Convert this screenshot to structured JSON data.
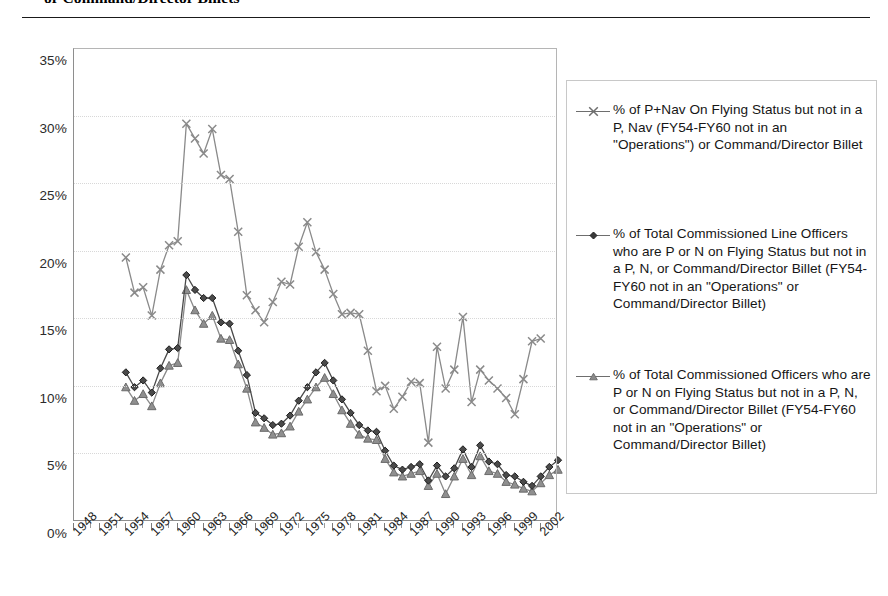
{
  "page": {
    "title_fragment": "or Command/Director Billets"
  },
  "legend": {
    "position": "right",
    "entries": [
      {
        "marker": "x-marker",
        "label": "% of P+Nav On Flying Status but not in a P, Nav (FY54-FY60 not in an \"Operations\") or Command/Director Billet",
        "color": "#808080"
      },
      {
        "marker": "diamond-marker",
        "label": "% of Total Commissioned Line Officers who are P or N on Flying Status but not in a P, N, or Command/Director Billet (FY54-FY60 not in an \"Operations\" or Command/Director Billet)",
        "color": "#3a3a3a"
      },
      {
        "marker": "triangle-marker",
        "label": "% of Total Commissioned Officers who are P or N on Flying Status but not in a P, N, or Command/Director Billet (FY54-FY60 not in an \"Operations\" or Command/Director Billet)",
        "color": "#808080"
      }
    ]
  },
  "chart_data": {
    "type": "line",
    "title": "or Command/Director Billets",
    "xlabel": "",
    "ylabel": "",
    "ylim": [
      0,
      35
    ],
    "ytick_labels": [
      "0%",
      "5%",
      "10%",
      "15%",
      "20%",
      "25%",
      "30%",
      "35%"
    ],
    "ytick_values": [
      0,
      5,
      10,
      15,
      20,
      25,
      30,
      35
    ],
    "grid": true,
    "xlim": [
      1948,
      2004
    ],
    "xtick_labels": [
      "1948",
      "1951",
      "1954",
      "1957",
      "1960",
      "1963",
      "1966",
      "1969",
      "1972",
      "1975",
      "1978",
      "1981",
      "1984",
      "1987",
      "1990",
      "1993",
      "1996",
      "1999",
      "2002"
    ],
    "xtick_values": [
      1948,
      1951,
      1954,
      1957,
      1960,
      1963,
      1966,
      1969,
      1972,
      1975,
      1978,
      1981,
      1984,
      1987,
      1990,
      1993,
      1996,
      1999,
      2002
    ],
    "x": [
      1954,
      1955,
      1956,
      1957,
      1958,
      1959,
      1960,
      1961,
      1962,
      1963,
      1964,
      1965,
      1966,
      1967,
      1968,
      1969,
      1970,
      1971,
      1972,
      1973,
      1974,
      1975,
      1976,
      1977,
      1978,
      1979,
      1980,
      1981,
      1982,
      1983,
      1984,
      1985,
      1986,
      1987,
      1988,
      1989,
      1990,
      1991,
      1992,
      1993,
      1994,
      1995,
      1996,
      1997,
      1998,
      1999,
      2000,
      2001,
      2002,
      2003,
      2004
    ],
    "series": [
      {
        "name": "% of P+Nav On Flying Status but not in a P, Nav (FY54-FY60 not in an \"Operations\") or Command/Director Billet",
        "marker": "x",
        "color": "#808080",
        "values": [
          19.5,
          16.9,
          17.3,
          15.2,
          18.6,
          20.4,
          20.7,
          29.4,
          28.3,
          27.2,
          29.0,
          25.6,
          25.3,
          21.4,
          16.7,
          15.6,
          14.7,
          16.2,
          17.7,
          17.5,
          20.3,
          22.1,
          19.9,
          18.6,
          16.8,
          15.3,
          15.4,
          15.3,
          12.6,
          9.6,
          10.0,
          8.3,
          9.2,
          10.3,
          10.2,
          5.8,
          12.9,
          9.8,
          11.2,
          15.1,
          8.8,
          11.2,
          10.4,
          9.8,
          9.1,
          7.9,
          10.5,
          13.3,
          13.5,
          null,
          null
        ]
      },
      {
        "name": "% of Total Commissioned Line Officers who are P or N on Flying Status but not in a P, N, or Command/Director Billet (FY54-FY60 not in an \"Operations\" or Command/Director Billet)",
        "marker": "diamond",
        "color": "#3a3a3a",
        "values": [
          11.0,
          9.9,
          10.4,
          9.5,
          11.3,
          12.7,
          12.8,
          18.2,
          17.1,
          16.5,
          16.5,
          14.7,
          14.6,
          12.6,
          10.8,
          8.0,
          7.6,
          7.1,
          7.2,
          7.8,
          8.9,
          9.9,
          11.0,
          11.7,
          10.4,
          9.0,
          8.0,
          7.1,
          6.7,
          6.6,
          5.2,
          4.1,
          3.8,
          4.0,
          4.2,
          3.0,
          4.1,
          3.3,
          3.9,
          5.3,
          4.0,
          5.6,
          4.4,
          4.2,
          3.4,
          3.3,
          2.9,
          2.6,
          3.3,
          4.0,
          4.5
        ]
      },
      {
        "name": "% of Total Commissioned Officers who are P or N on Flying Status but not in a P, N, or Command/Director Billet (FY54-FY60 not in an \"Operations\" or Command/Director Billet)",
        "marker": "triangle",
        "color": "#808080",
        "values": [
          9.9,
          8.9,
          9.4,
          8.5,
          10.2,
          11.5,
          11.7,
          17.1,
          15.6,
          14.6,
          15.2,
          13.5,
          13.4,
          11.6,
          9.8,
          7.3,
          6.9,
          6.4,
          6.5,
          7.0,
          8.1,
          9.0,
          9.9,
          10.6,
          9.4,
          8.2,
          7.2,
          6.4,
          6.1,
          6.0,
          4.6,
          3.6,
          3.3,
          3.5,
          3.7,
          2.6,
          3.5,
          2.0,
          3.3,
          4.6,
          3.4,
          4.8,
          3.7,
          3.5,
          2.9,
          2.7,
          2.4,
          2.2,
          2.8,
          3.4,
          3.8
        ]
      }
    ]
  }
}
